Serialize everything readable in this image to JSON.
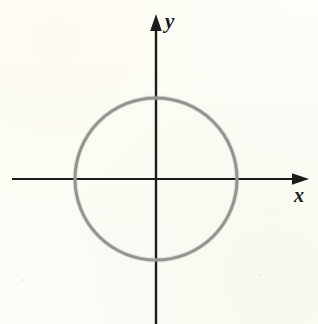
{
  "figure": {
    "background_color": "#fcfcf8",
    "axis_color": "#1b1b1b",
    "curve_color": "#8a8a86",
    "label_color": "#1b1b1b"
  },
  "axes": {
    "x_axis": {
      "label": "x",
      "arrow": "arrow-right",
      "start_px": 12,
      "end_px": 309,
      "y_px": 179
    },
    "y_axis": {
      "label": "y",
      "arrow": "arrow-up",
      "start_px": 324,
      "end_px": 14,
      "x_px": 156
    },
    "origin": {
      "x_px": 156,
      "y_px": 179
    }
  },
  "chart_data": {
    "type": "scatter",
    "title": "",
    "subtitle": "",
    "xlabel": "x",
    "ylabel": "y",
    "grid": false,
    "legend": null,
    "xlim": [
      -1.8,
      1.9
    ],
    "ylim": [
      -1.8,
      1.9
    ],
    "x_ticks": [],
    "y_ticks": [],
    "annotations": [],
    "series": [
      {
        "name": "circle",
        "kind": "circle",
        "center": [
          0,
          0
        ],
        "radius": 1,
        "equation": "x^2 + y^2 = r^2",
        "stroke_color": "#8a8a86",
        "stroke_width_px": 3,
        "fill": "none",
        "center_px": [
          156,
          179
        ],
        "radius_px": 81,
        "x_intercepts_px": [
          75,
          237
        ],
        "y_intercepts_px": [
          98,
          260
        ]
      }
    ]
  }
}
